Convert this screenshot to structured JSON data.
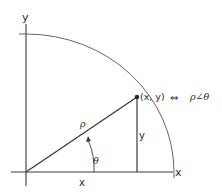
{
  "diagram": {
    "axes": {
      "x_label": "x",
      "y_label": "y"
    },
    "point_label": "(x, y)",
    "equivalence_symbol": "⇔",
    "polar_form": "ρ∠θ",
    "radius_label": "ρ",
    "angle_label": "θ",
    "x_component_label": "x",
    "y_component_label": "y",
    "colors": {
      "line": "#3a3a3a",
      "text": "#2a2a2a",
      "background": "#ffffff"
    }
  }
}
